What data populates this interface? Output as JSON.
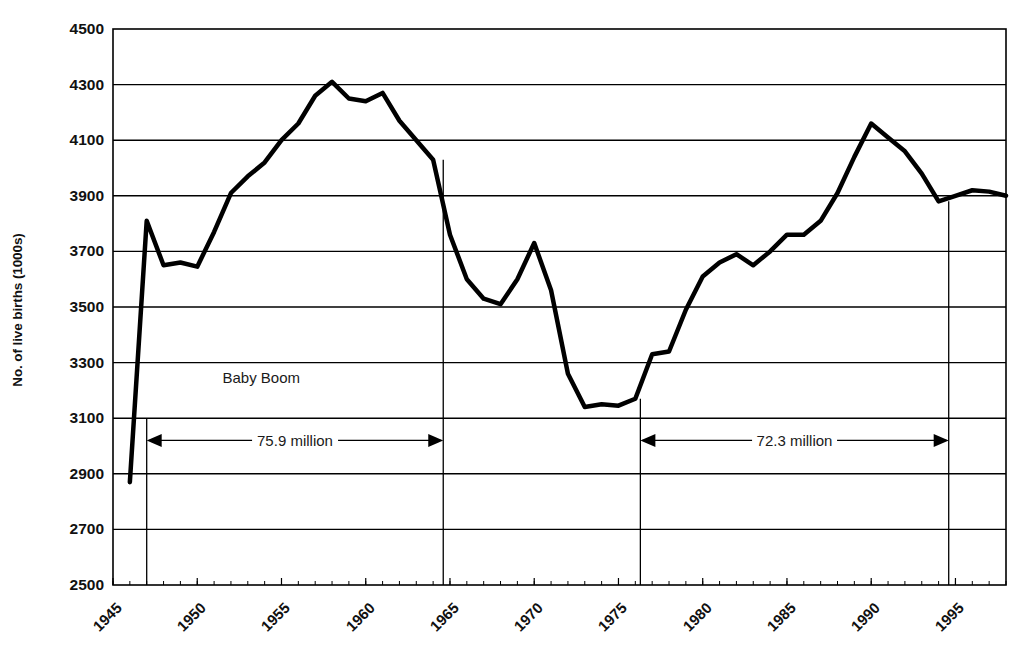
{
  "chart_data": {
    "type": "line",
    "title": "",
    "xlabel": "",
    "ylabel": "No. of live births (1000s)",
    "xlim": [
      1945,
      1998
    ],
    "ylim": [
      2500,
      4500
    ],
    "grid": true,
    "legend": "none",
    "y_ticks": [
      4500,
      4300,
      4100,
      3900,
      3700,
      3500,
      3300,
      3100,
      2900,
      2700,
      2500
    ],
    "x_ticks": [
      1945,
      1950,
      1955,
      1960,
      1965,
      1970,
      1975,
      1980,
      1985,
      1990,
      1995
    ],
    "x_tick_labels": [
      "1945",
      "1950",
      "1955",
      "1960",
      "1965",
      "1970",
      "1975",
      "1980",
      "1985",
      "1990",
      "1995"
    ],
    "x_minor_tick_interval": 1,
    "series": [
      {
        "name": "Live births",
        "color": "#000000",
        "line_width": 4.5,
        "x": [
          1946,
          1947,
          1948,
          1949,
          1950,
          1951,
          1952,
          1953,
          1954,
          1955,
          1956,
          1957,
          1958,
          1959,
          1960,
          1961,
          1962,
          1963,
          1964,
          1965,
          1966,
          1967,
          1968,
          1969,
          1970,
          1971,
          1972,
          1973,
          1974,
          1975,
          1976,
          1977,
          1978,
          1979,
          1980,
          1981,
          1982,
          1983,
          1984,
          1985,
          1986,
          1987,
          1988,
          1989,
          1990,
          1991,
          1992,
          1993,
          1994,
          1995,
          1996,
          1997,
          1998
        ],
        "y": [
          2870,
          3810,
          3650,
          3660,
          3645,
          3770,
          3910,
          3970,
          4020,
          4100,
          4160,
          4260,
          4310,
          4250,
          4240,
          4270,
          4170,
          4100,
          4030,
          3760,
          3600,
          3530,
          3510,
          3600,
          3730,
          3560,
          3260,
          3140,
          3150,
          3145,
          3170,
          3330,
          3340,
          3490,
          3610,
          3660,
          3690,
          3650,
          3700,
          3760,
          3760,
          3810,
          3910,
          4040,
          4160,
          4110,
          4060,
          3980,
          3880,
          3900,
          3920,
          3915,
          3900
        ]
      }
    ],
    "annotations": [
      {
        "name": "baby-boom-label",
        "text": "Baby Boom",
        "x": 1953.8,
        "y": 3250
      },
      {
        "name": "baby-boom-span",
        "text": "75.9 million",
        "type": "double-arrow",
        "x_start": 1947,
        "x_end": 1964.6,
        "y": 3020
      },
      {
        "name": "echo-boom-span",
        "text": "72.3 million",
        "type": "double-arrow",
        "x_start": 1976.3,
        "x_end": 1994.6,
        "y": 3020
      }
    ],
    "vertical_markers": [
      {
        "name": "marker-1947",
        "x": 1947,
        "y_top": 3100,
        "y_bottom": 2500
      },
      {
        "name": "marker-1964",
        "x": 1964.6,
        "y_top": 4030,
        "y_bottom": 2500
      },
      {
        "name": "marker-1976",
        "x": 1976.3,
        "y_top": 3170,
        "y_bottom": 2500
      },
      {
        "name": "marker-1994",
        "x": 1994.6,
        "y_top": 3880,
        "y_bottom": 2500
      }
    ]
  }
}
